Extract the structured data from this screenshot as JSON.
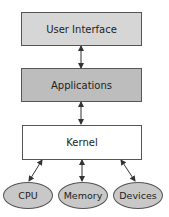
{
  "diagram": {
    "layers": [
      {
        "label": "User Interface",
        "fill": "#d6d6d6"
      },
      {
        "label": "Applications",
        "fill": "#bdbdbd"
      },
      {
        "label": "Kernel",
        "fill": "#ffffff"
      }
    ],
    "resources": [
      {
        "label": "CPU"
      },
      {
        "label": "Memory"
      },
      {
        "label": "Devices"
      }
    ],
    "connections": [
      {
        "from": "User Interface",
        "to": "Applications",
        "type": "bidirectional"
      },
      {
        "from": "Applications",
        "to": "Kernel",
        "type": "bidirectional"
      },
      {
        "from": "Kernel",
        "to": "CPU",
        "type": "bidirectional"
      },
      {
        "from": "Kernel",
        "to": "Memory",
        "type": "bidirectional"
      },
      {
        "from": "Kernel",
        "to": "Devices",
        "type": "bidirectional"
      }
    ]
  }
}
